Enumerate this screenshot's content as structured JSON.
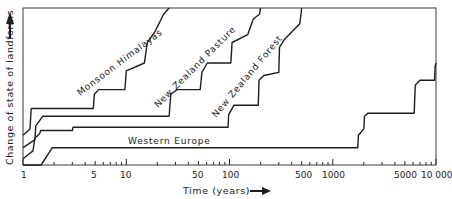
{
  "chart_data": {
    "type": "line",
    "title": "",
    "xlabel": "Time (years)",
    "ylabel": "Change of state of landforms",
    "xscale": "log",
    "xlim": [
      1,
      10000
    ],
    "ylim": [
      0,
      100
    ],
    "grid": false,
    "legend": "inline labels",
    "x_ticks": [
      1,
      5,
      10,
      50,
      100,
      500,
      1000,
      5000,
      10000
    ],
    "x_tick_labels": [
      "1",
      "5",
      "10",
      "50",
      "100",
      "500",
      "1000",
      "5000",
      "10 000"
    ],
    "series": [
      {
        "name": "Monsoon Himalayas",
        "x": [
          1,
          1.17,
          1.2,
          4.8,
          4.9,
          5.4,
          9.7,
          10.0,
          15,
          16,
          19,
          23,
          26
        ],
        "y": [
          19,
          23,
          36,
          36,
          45,
          48,
          48,
          60,
          65,
          78,
          85,
          96,
          100
        ]
      },
      {
        "name": "New Zealand Pasture",
        "x": [
          1,
          1.3,
          1.33,
          1.55,
          26,
          27,
          31,
          52,
          54,
          61,
          103,
          106,
          150,
          170,
          195,
          200
        ],
        "y": [
          11,
          16,
          25,
          31,
          31,
          45,
          48,
          48,
          59,
          65,
          65,
          78,
          83,
          93,
          96,
          100
        ]
      },
      {
        "name": "New Zealand Forest",
        "x": [
          1,
          1.25,
          1.3,
          1.45,
          1.48,
          3.0,
          3.05,
          97,
          98,
          110,
          190,
          193,
          215,
          300,
          305,
          340,
          480,
          500
        ],
        "y": [
          4,
          9,
          17,
          20,
          22,
          22,
          24,
          24,
          32,
          38,
          38,
          54,
          57,
          59,
          75,
          80,
          90,
          100
        ]
      },
      {
        "name": "Western Europe",
        "x": [
          1,
          1.5,
          1.92,
          1750,
          1770,
          2000,
          2030,
          2180,
          6150,
          6200,
          6300,
          7000,
          9700,
          9800,
          10000
        ],
        "y": [
          0,
          0,
          11,
          11,
          19,
          23,
          31,
          33,
          33,
          40,
          51,
          54,
          54,
          63,
          65
        ]
      }
    ],
    "annotations": [
      {
        "text": "Monsoon Himalayas",
        "near_x": 3.2,
        "near_y": 55
      },
      {
        "text": "New Zealand Pasture",
        "near_x": 18,
        "near_y": 48
      },
      {
        "text": "New Zealand Forest",
        "near_x": 60,
        "near_y": 36
      },
      {
        "text": "Western Europe",
        "near_x": 20,
        "near_y": 14
      }
    ]
  },
  "labels": {
    "ylabel": "Change of state of landforms",
    "xlabel": "Time (years)",
    "series": {
      "monsoon": "Monsoon Himalayas",
      "pasture": "New Zealand Pasture",
      "forest": "New Zealand Forest",
      "europe": "Western Europe"
    }
  },
  "ticks": {
    "t1": "1",
    "t5": "5",
    "t10": "10",
    "t50": "50",
    "t100": "100",
    "t500": "500",
    "t1000": "1000",
    "t5000": "5000",
    "t10000": "10 000"
  }
}
